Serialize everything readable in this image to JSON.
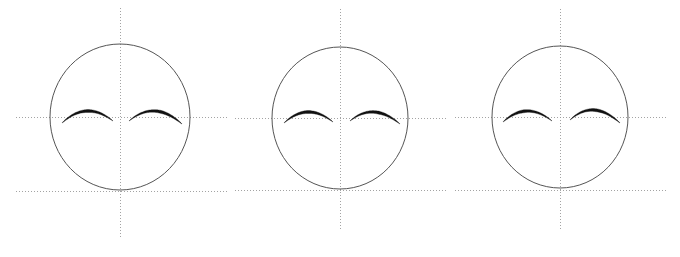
{
  "figure": {
    "background_color": "#ffffff",
    "width": 680,
    "height": 257,
    "panel_count": 3
  },
  "style": {
    "outline_color": "#555555",
    "outline_width": 1.0,
    "guide_color": "#999999",
    "guide_width": 0.9,
    "guide_dash": "1,2",
    "stroke_color": "#111111",
    "stroke_max_width": 3.0
  },
  "chart_data": {
    "type": "scatter",
    "subtitle": "",
    "xlabel": "",
    "ylabel": "",
    "grid": false,
    "legend": "none",
    "annotations": [],
    "panels": [
      {
        "name": "panel-1",
        "label": "",
        "head_outline": {
          "shape": "ellipse",
          "cx": 120.0,
          "cy": 117.0,
          "rx": 70.0,
          "ry": 73.0
        },
        "vertical_axis": {
          "x": 120.0,
          "y_start": 8.0,
          "y_end": 238.0
        },
        "horizontal_axis": {
          "y": 117.0,
          "x_start": 16.0,
          "x_end": 228.0
        },
        "baseline": {
          "y": 191.0,
          "x_start": 16.0,
          "x_end": 228.0
        },
        "eyes": [
          {
            "name": "left-eye-arc",
            "x_start": 62.0,
            "x_end": 113.0,
            "y_start": 123.0,
            "y_end": 121.0,
            "apex_x": 87.0,
            "apex_y": 111.0,
            "thick_at": 0.52
          },
          {
            "name": "right-eye-arc",
            "x_start": 129.0,
            "x_end": 182.0,
            "y_start": 121.0,
            "y_end": 124.0,
            "apex_x": 155.0,
            "apex_y": 111.0,
            "thick_at": 0.62
          }
        ]
      },
      {
        "name": "panel-2",
        "label": "",
        "head_outline": {
          "shape": "ellipse",
          "cx": 340.0,
          "cy": 118.0,
          "rx": 68.0,
          "ry": 71.0
        },
        "vertical_axis": {
          "x": 340.0,
          "y_start": 9.0,
          "y_end": 230.0
        },
        "horizontal_axis": {
          "y": 118.0,
          "x_start": 235.0,
          "x_end": 448.0
        },
        "baseline": {
          "y": 190.0,
          "x_start": 235.0,
          "x_end": 448.0
        },
        "eyes": [
          {
            "name": "left-eye-arc",
            "x_start": 284.0,
            "x_end": 333.0,
            "y_start": 123.0,
            "y_end": 122.0,
            "apex_x": 308.0,
            "apex_y": 112.0,
            "thick_at": 0.5
          },
          {
            "name": "right-eye-arc",
            "x_start": 350.0,
            "x_end": 400.0,
            "y_start": 121.0,
            "y_end": 124.0,
            "apex_x": 374.0,
            "apex_y": 112.0,
            "thick_at": 0.58
          }
        ]
      },
      {
        "name": "panel-3",
        "label": "",
        "head_outline": {
          "shape": "ellipse",
          "cx": 560.0,
          "cy": 117.0,
          "rx": 68.0,
          "ry": 71.0
        },
        "vertical_axis": {
          "x": 560.0,
          "y_start": 9.0,
          "y_end": 230.0
        },
        "horizontal_axis": {
          "y": 117.0,
          "x_start": 455.0,
          "x_end": 668.0
        },
        "baseline": {
          "y": 190.0,
          "x_start": 455.0,
          "x_end": 668.0
        },
        "eyes": [
          {
            "name": "left-eye-arc",
            "x_start": 503.0,
            "x_end": 552.0,
            "y_start": 122.0,
            "y_end": 121.0,
            "apex_x": 527.0,
            "apex_y": 111.0,
            "thick_at": 0.42
          },
          {
            "name": "right-eye-arc",
            "x_start": 570.0,
            "x_end": 620.0,
            "y_start": 120.0,
            "y_end": 123.0,
            "apex_x": 594.0,
            "apex_y": 110.0,
            "thick_at": 0.55
          }
        ]
      }
    ]
  }
}
